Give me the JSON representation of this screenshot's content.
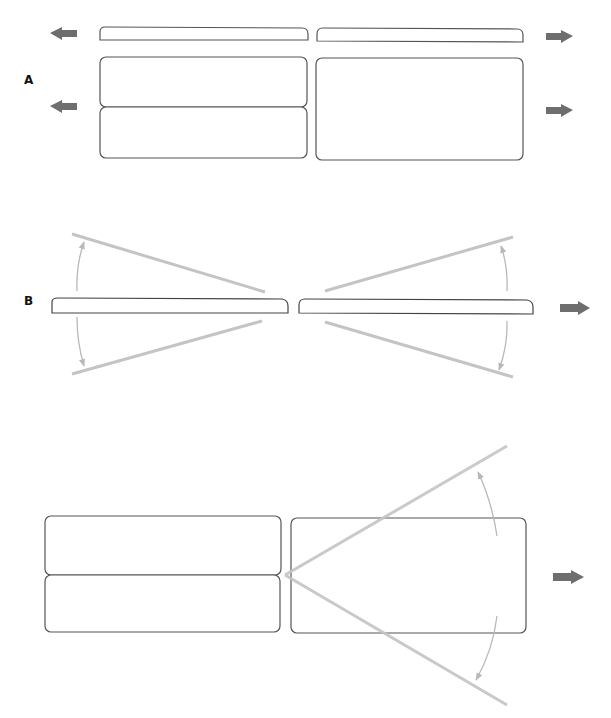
{
  "panels": [
    {
      "label": "A",
      "description": "Two stacked boxes left, one box right, thin bars above; moving apart horizontally"
    },
    {
      "label": "B",
      "description": "Two thin bars rotating about their inner ends, with angular arrows"
    },
    {
      "label": "",
      "description": "Stacked boxes left, box right with wedge lines opening from left junction"
    }
  ],
  "colors": {
    "outline": "#555555",
    "guide_line": "#c4c4c4",
    "arrow_fill": "#6e6e6e",
    "angle_arrow": "#b8b8b8"
  }
}
